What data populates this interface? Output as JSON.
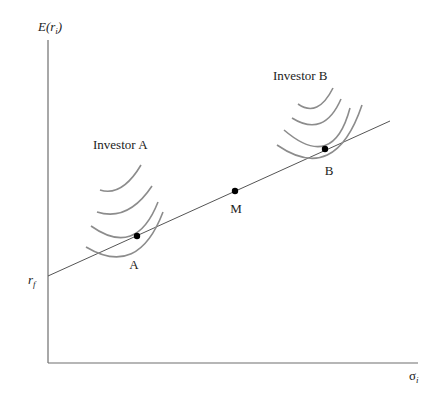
{
  "diagram": {
    "type": "capital-market-line",
    "y_axis_label": {
      "base": "E(r",
      "sub": "i",
      "close": ")"
    },
    "x_axis_label": {
      "base": "σ",
      "sub": "i"
    },
    "intercept_label": {
      "base": "r",
      "sub": "f"
    },
    "investor_a_label": "Investor A",
    "investor_b_label": "Investor B",
    "points": [
      {
        "name": "A",
        "label": "A"
      },
      {
        "name": "M",
        "label": "M"
      },
      {
        "name": "B",
        "label": "B"
      }
    ],
    "indifference_curves": {
      "investor_a_count": 4,
      "investor_b_count": 4
    },
    "colors": {
      "axis": "#6e6e6e",
      "line": "#555555",
      "curves": "#8c8c8c",
      "points": "#000000"
    }
  }
}
